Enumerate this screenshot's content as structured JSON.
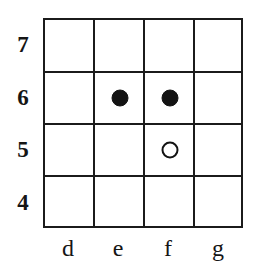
{
  "diagram": {
    "type": "board-grid",
    "title": "",
    "columns": 4,
    "rows": 4,
    "line_color": "#1b1b1b",
    "background_color": "#ffffff",
    "file_labels": [
      "d",
      "e",
      "f",
      "g"
    ],
    "rank_labels": [
      "7",
      "6",
      "5",
      "4"
    ],
    "markers": [
      {
        "file": "e",
        "rank": "6",
        "style": "filled",
        "label": "",
        "color": "#131313"
      },
      {
        "file": "f",
        "rank": "6",
        "style": "filled",
        "label": "",
        "color": "#131313"
      },
      {
        "file": "f",
        "rank": "5",
        "style": "open",
        "label": "",
        "color": "#131313"
      }
    ]
  }
}
